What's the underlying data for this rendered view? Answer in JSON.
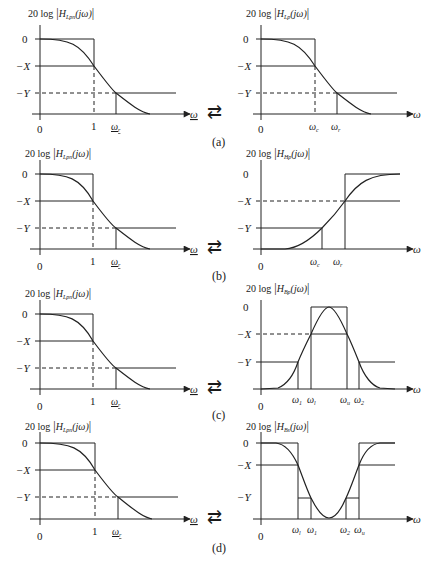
{
  "figure": {
    "exchange_symbol": "⇄",
    "panels": [
      {
        "label": "(a)",
        "left": {
          "ylabel_prefix": "20 log",
          "ylabel_fn": "H",
          "ylabel_sub": "Lpn",
          "ylabel_arg": "(jω)",
          "y_ticks": [
            "0",
            "−X",
            "−Y"
          ],
          "x_ticks": [
            "0",
            "1",
            "ω",
            "r"
          ],
          "x_axis": "ω"
        },
        "right": {
          "ylabel_prefix": "20 log",
          "ylabel_fn": "H",
          "ylabel_sub": "Lp",
          "ylabel_arg": "(jω)",
          "y_ticks": [
            "0",
            "−X",
            "−Y"
          ],
          "x_ticks": [
            "0",
            "ω",
            "c",
            "ω",
            "r"
          ],
          "x_axis": "ω"
        }
      },
      {
        "label": "(b)",
        "left": {
          "ylabel_prefix": "20 log",
          "ylabel_fn": "H",
          "ylabel_sub": "Lpn",
          "ylabel_arg": "(jω)",
          "y_ticks": [
            "0",
            "−X",
            "−Y"
          ],
          "x_ticks": [
            "0",
            "1",
            "ω",
            "r"
          ],
          "x_axis": "ω"
        },
        "right": {
          "ylabel_prefix": "20 log",
          "ylabel_fn": "H",
          "ylabel_sub": "Hp",
          "ylabel_arg": "(jω)",
          "y_ticks": [
            "0",
            "−X",
            "−Y"
          ],
          "x_ticks": [
            "0",
            "ω",
            "c",
            "ω",
            "r"
          ],
          "x_axis": "ω"
        }
      },
      {
        "label": "(c)",
        "left": {
          "ylabel_prefix": "20 log",
          "ylabel_fn": "H",
          "ylabel_sub": "Lpn",
          "ylabel_arg": "(jω)",
          "y_ticks": [
            "0",
            "−X",
            "−Y"
          ],
          "x_ticks": [
            "0",
            "1",
            "ω",
            "r"
          ],
          "x_axis": "ω"
        },
        "right": {
          "ylabel_prefix": "20 log",
          "ylabel_fn": "H",
          "ylabel_sub": "Bp",
          "ylabel_arg": "(jω)",
          "y_ticks": [
            "0",
            "−X",
            "−Y"
          ],
          "x_ticks": [
            "0",
            "ω",
            "1",
            "ω",
            "l",
            "ω",
            "u",
            "ω",
            "2"
          ],
          "x_axis": "ω"
        }
      },
      {
        "label": "(d)",
        "left": {
          "ylabel_prefix": "20 log",
          "ylabel_fn": "H",
          "ylabel_sub": "Lpn",
          "ylabel_arg": "(jω)",
          "y_ticks": [
            "0",
            "−X",
            "−Y"
          ],
          "x_ticks": [
            "0",
            "1",
            "ω",
            "r"
          ],
          "x_axis": "ω"
        },
        "right": {
          "ylabel_prefix": "20 log",
          "ylabel_fn": "H",
          "ylabel_sub": "Bs",
          "ylabel_arg": "(jω)",
          "y_ticks": [
            "0",
            "−X",
            "−Y"
          ],
          "x_ticks": [
            "0",
            "ω",
            "l",
            "ω",
            "1",
            "ω",
            "2",
            "ω",
            "u"
          ],
          "x_axis": "ω"
        }
      }
    ]
  }
}
